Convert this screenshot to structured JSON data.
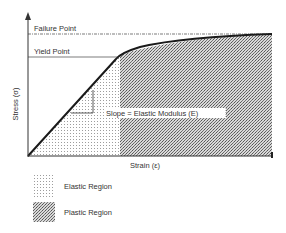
{
  "diagram": {
    "y_axis_label": "Stress (σ)",
    "x_axis_label": "Strain (ε)",
    "annotations": {
      "failure_point": "Failure Point",
      "yield_point": "Yield Point",
      "slope": "Slope = Elastic Modulus (E)"
    },
    "legend": [
      {
        "label": "Elastic Region",
        "pattern": "fine-dots"
      },
      {
        "label": "Plastic Region",
        "pattern": "dense-dither"
      }
    ],
    "colors": {
      "axis": "#333333",
      "curve": "#1a1a1a",
      "pattern_ink": "#555555",
      "background": "#ffffff"
    }
  }
}
